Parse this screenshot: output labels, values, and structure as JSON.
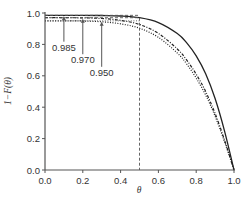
{
  "chart_data": {
    "type": "line",
    "title": "",
    "xlabel": "θ",
    "ylabel": "1−F(θ)",
    "xlim": [
      0.0,
      1.0
    ],
    "ylim": [
      0.0,
      1.0
    ],
    "xticks": [
      "0.0",
      "0.2",
      "0.4",
      "0.6",
      "0.8",
      "1.0"
    ],
    "yticks": [
      "0.0",
      "0.2",
      "0.4",
      "0.6",
      "0.8",
      "1.0"
    ],
    "grid": false,
    "legend": null,
    "series": [
      {
        "name": "0.985",
        "style": "solid",
        "x": [
          0.0,
          0.1,
          0.2,
          0.3,
          0.4,
          0.5,
          0.6,
          0.7,
          0.75,
          0.8,
          0.85,
          0.9,
          0.95,
          1.0
        ],
        "values": [
          0.985,
          0.985,
          0.985,
          0.984,
          0.981,
          0.97,
          0.939,
          0.869,
          0.81,
          0.727,
          0.613,
          0.455,
          0.248,
          0.0
        ]
      },
      {
        "name": "0.970",
        "style": "dash-dot",
        "x": [
          0.0,
          0.1,
          0.2,
          0.3,
          0.4,
          0.5,
          0.6,
          0.7,
          0.75,
          0.8,
          0.85,
          0.9,
          0.95,
          1.0
        ],
        "values": [
          0.97,
          0.97,
          0.969,
          0.965,
          0.953,
          0.927,
          0.87,
          0.771,
          0.7,
          0.61,
          0.5,
          0.36,
          0.19,
          0.0
        ]
      },
      {
        "name": "0.950",
        "style": "dotted",
        "x": [
          0.0,
          0.1,
          0.2,
          0.3,
          0.4,
          0.5,
          0.6,
          0.7,
          0.75,
          0.8,
          0.85,
          0.9,
          0.95,
          1.0
        ],
        "values": [
          0.95,
          0.95,
          0.949,
          0.944,
          0.931,
          0.903,
          0.845,
          0.745,
          0.675,
          0.585,
          0.478,
          0.343,
          0.18,
          0.0
        ]
      }
    ],
    "reference_lines": [
      {
        "orientation": "vertical",
        "x": 0.5,
        "style": "dashed"
      },
      {
        "orientation": "horizontal",
        "y": 0.985,
        "style": "dashed",
        "xrange": [
          0.0,
          0.5
        ]
      },
      {
        "orientation": "horizontal",
        "y": 0.97,
        "style": "dashed",
        "xrange": [
          0.0,
          0.5
        ]
      },
      {
        "orientation": "horizontal",
        "y": 0.95,
        "style": "dotted",
        "xrange": [
          0.0,
          0.5
        ]
      }
    ],
    "annotations": [
      {
        "text": "0.985",
        "arrow_x": 0.1,
        "arrow_to_y": 0.985,
        "label_y": 0.76
      },
      {
        "text": "0.970",
        "arrow_x": 0.2,
        "arrow_to_y": 0.97,
        "label_y": 0.68
      },
      {
        "text": "0.950",
        "arrow_x": 0.3,
        "arrow_to_y": 0.95,
        "label_y": 0.6
      }
    ]
  },
  "colors": {
    "axis": "#555555",
    "curve": "#222222",
    "reference": "#555555",
    "text": "#333333"
  }
}
